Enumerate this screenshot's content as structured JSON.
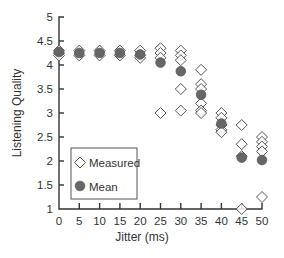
{
  "chart_data": {
    "type": "scatter",
    "title": "",
    "xlabel": "Jitter (ms)",
    "ylabel": "Listening Quality",
    "xlim": [
      0,
      50
    ],
    "ylim": [
      1,
      5
    ],
    "x_ticks": [
      0,
      5,
      10,
      15,
      20,
      25,
      30,
      35,
      40,
      45,
      50
    ],
    "y_ticks": [
      1,
      1.5,
      2,
      2.5,
      3,
      3.5,
      4,
      4.5,
      5
    ],
    "x_tick_labels": [
      "0",
      "5",
      "10",
      "15",
      "20",
      "25",
      "30",
      "35",
      "40",
      "45",
      "50"
    ],
    "y_tick_labels": [
      "1",
      "1.5",
      "2",
      "2.5",
      "3",
      "3.5",
      "4",
      "4.5",
      "5"
    ],
    "grid": false,
    "legend": {
      "position": "lower-left",
      "entries": [
        "Measured",
        "Mean"
      ]
    },
    "series": [
      {
        "name": "Measured",
        "marker": "open-diamond",
        "color": "#555555",
        "points": [
          [
            0,
            4.3
          ],
          [
            0,
            4.25
          ],
          [
            0,
            4.2
          ],
          [
            5,
            4.3
          ],
          [
            5,
            4.2
          ],
          [
            10,
            4.3
          ],
          [
            10,
            4.2
          ],
          [
            15,
            4.3
          ],
          [
            15,
            4.2
          ],
          [
            20,
            4.3
          ],
          [
            20,
            4.2
          ],
          [
            20,
            4.15
          ],
          [
            25,
            4.35
          ],
          [
            25,
            4.25
          ],
          [
            25,
            4.15
          ],
          [
            25,
            3.0
          ],
          [
            30,
            4.3
          ],
          [
            30,
            4.2
          ],
          [
            30,
            4.1
          ],
          [
            30,
            3.5
          ],
          [
            30,
            3.05
          ],
          [
            35,
            3.9
          ],
          [
            35,
            3.6
          ],
          [
            35,
            3.5
          ],
          [
            35,
            3.2
          ],
          [
            35,
            3.05
          ],
          [
            35,
            3.0
          ],
          [
            40,
            3.0
          ],
          [
            40,
            2.9
          ],
          [
            40,
            2.75
          ],
          [
            40,
            2.65
          ],
          [
            40,
            2.6
          ],
          [
            45,
            2.75
          ],
          [
            45,
            2.35
          ],
          [
            45,
            2.1
          ],
          [
            45,
            1.0
          ],
          [
            50,
            2.5
          ],
          [
            50,
            2.4
          ],
          [
            50,
            2.3
          ],
          [
            50,
            2.2
          ],
          [
            50,
            1.25
          ]
        ]
      },
      {
        "name": "Mean",
        "marker": "filled-circle",
        "color": "#666666",
        "x": [
          0,
          5,
          10,
          15,
          20,
          25,
          30,
          35,
          40,
          45,
          50
        ],
        "values": [
          4.27,
          4.25,
          4.25,
          4.25,
          4.22,
          4.05,
          3.87,
          3.38,
          2.78,
          2.07,
          2.02
        ]
      }
    ]
  },
  "legend": {
    "measured_label": "Measured",
    "mean_label": "Mean"
  },
  "axes": {
    "x_title": "Jitter (ms)",
    "y_title": "Listening Quality"
  },
  "colors": {
    "axis": "#333333",
    "diamond_stroke": "#555555",
    "mean_fill": "#666666",
    "legend_border": "#555555"
  }
}
